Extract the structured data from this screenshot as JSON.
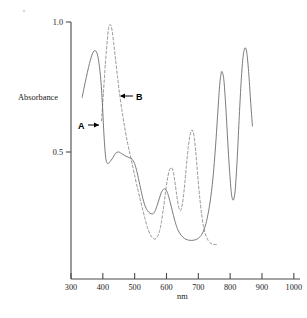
{
  "figure": {
    "name": "absorbance-spectrum",
    "background_color": "#ffffff"
  },
  "axes": {
    "y_title": "Absorbance",
    "x_title": "nm",
    "y_ticks": [
      {
        "value": 1.0,
        "label": "1.0"
      },
      {
        "value": 0.5,
        "label": "0.5"
      }
    ],
    "x_ticks": [
      {
        "value": 300,
        "label": "300"
      },
      {
        "value": 400,
        "label": "400"
      },
      {
        "value": 500,
        "label": "500"
      },
      {
        "value": 600,
        "label": "600"
      },
      {
        "value": 700,
        "label": "700"
      },
      {
        "value": 800,
        "label": "800"
      },
      {
        "value": 900,
        "label": "900"
      },
      {
        "value": 1000,
        "label": "1000"
      }
    ]
  },
  "annotations": [
    {
      "id": "label-a",
      "text": "A",
      "target_series": "A"
    },
    {
      "id": "label-b",
      "text": "B",
      "target_series": "B"
    }
  ],
  "chart_data": {
    "type": "line",
    "title": "",
    "subtitle": "",
    "xlabel": "nm",
    "ylabel": "Absorbance",
    "xlim": [
      300,
      1000
    ],
    "ylim": [
      0.0,
      1.05
    ],
    "grid": false,
    "legend_position": "inline-annotations",
    "x_tick_labels": [
      "300",
      "400",
      "500",
      "600",
      "700",
      "800",
      "900",
      "1000"
    ],
    "y_tick_labels": [
      "0.5",
      "1.0"
    ],
    "annotations": [
      {
        "text": "A",
        "x": 355,
        "y": 0.6,
        "points_to_x": 400,
        "points_to_y": 0.6
      },
      {
        "text": "B",
        "x": 510,
        "y": 0.71,
        "points_to_x": 455,
        "points_to_y": 0.71
      }
    ],
    "series": [
      {
        "name": "A",
        "style": "solid",
        "color": "#6b6b6b",
        "x": [
          335,
          345,
          358,
          368,
          376,
          384,
          392,
          398,
          402,
          406,
          410,
          416,
          422,
          430,
          440,
          450,
          460,
          468,
          476,
          484,
          492,
          500,
          508,
          516,
          524,
          532,
          540,
          548,
          556,
          562,
          568,
          576,
          584,
          592,
          598,
          604,
          612,
          620,
          628,
          636,
          646,
          656,
          666,
          678,
          690,
          700,
          712,
          724,
          736,
          746,
          754,
          760,
          766,
          770,
          774,
          780,
          786,
          792,
          798,
          804,
          810,
          816,
          822,
          828,
          834,
          840,
          846,
          852,
          858,
          864,
          870
        ],
        "y": [
          0.71,
          0.77,
          0.84,
          0.88,
          0.89,
          0.87,
          0.8,
          0.7,
          0.6,
          0.52,
          0.47,
          0.455,
          0.462,
          0.475,
          0.495,
          0.5,
          0.493,
          0.487,
          0.482,
          0.478,
          0.472,
          0.455,
          0.42,
          0.375,
          0.33,
          0.295,
          0.275,
          0.265,
          0.262,
          0.268,
          0.285,
          0.315,
          0.345,
          0.358,
          0.355,
          0.34,
          0.305,
          0.265,
          0.228,
          0.2,
          0.18,
          0.168,
          0.162,
          0.16,
          0.162,
          0.168,
          0.185,
          0.225,
          0.3,
          0.4,
          0.52,
          0.63,
          0.74,
          0.79,
          0.81,
          0.78,
          0.68,
          0.55,
          0.43,
          0.34,
          0.315,
          0.355,
          0.47,
          0.62,
          0.76,
          0.86,
          0.9,
          0.885,
          0.81,
          0.7,
          0.6
        ]
      },
      {
        "name": "B",
        "style": "dashed",
        "color": "#8a8a8a",
        "x": [
          396,
          402,
          408,
          414,
          418,
          422,
          426,
          430,
          434,
          440,
          446,
          452,
          460,
          468,
          476,
          484,
          492,
          500,
          508,
          516,
          524,
          532,
          540,
          548,
          554,
          560,
          566,
          572,
          578,
          584,
          590,
          596,
          602,
          608,
          614,
          620,
          626,
          632,
          638,
          644,
          650,
          656,
          662,
          668,
          674,
          680,
          686,
          692,
          698,
          704,
          710,
          716,
          722,
          730,
          738,
          746,
          754,
          762
        ],
        "y": [
          0.62,
          0.73,
          0.84,
          0.93,
          0.975,
          0.99,
          0.985,
          0.96,
          0.92,
          0.855,
          0.79,
          0.73,
          0.66,
          0.6,
          0.545,
          0.5,
          0.455,
          0.41,
          0.365,
          0.325,
          0.285,
          0.245,
          0.21,
          0.185,
          0.172,
          0.166,
          0.166,
          0.175,
          0.195,
          0.23,
          0.28,
          0.335,
          0.39,
          0.425,
          0.44,
          0.43,
          0.39,
          0.335,
          0.29,
          0.275,
          0.3,
          0.36,
          0.44,
          0.515,
          0.565,
          0.585,
          0.565,
          0.5,
          0.41,
          0.33,
          0.265,
          0.215,
          0.185,
          0.162,
          0.15,
          0.145,
          0.144,
          0.145
        ]
      }
    ]
  }
}
